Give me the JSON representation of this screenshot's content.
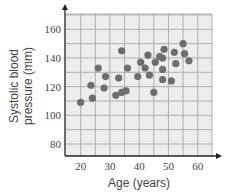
{
  "chart_data": {
    "type": "scatter",
    "title": "",
    "xlabel": "Age (years)",
    "ylabel": "Systolic blood pressure (mm)",
    "ylabel_lines": [
      "Systolic blood",
      "pressure (mm)"
    ],
    "xlim": [
      15,
      65
    ],
    "ylim": [
      70,
      170
    ],
    "xticks": [
      20,
      30,
      40,
      50,
      60
    ],
    "yticks": [
      80,
      100,
      120,
      140,
      160
    ],
    "grid": true,
    "legend": null,
    "points": [
      {
        "x": 20,
        "y": 109
      },
      {
        "x": 23.5,
        "y": 121
      },
      {
        "x": 24,
        "y": 112
      },
      {
        "x": 26,
        "y": 133
      },
      {
        "x": 28.5,
        "y": 127
      },
      {
        "x": 28,
        "y": 119
      },
      {
        "x": 32,
        "y": 114
      },
      {
        "x": 33,
        "y": 126
      },
      {
        "x": 34,
        "y": 145
      },
      {
        "x": 34,
        "y": 116
      },
      {
        "x": 35.5,
        "y": 117
      },
      {
        "x": 36,
        "y": 133
      },
      {
        "x": 39.5,
        "y": 127
      },
      {
        "x": 40.5,
        "y": 137
      },
      {
        "x": 42,
        "y": 133
      },
      {
        "x": 43,
        "y": 142
      },
      {
        "x": 43.5,
        "y": 128
      },
      {
        "x": 45,
        "y": 116
      },
      {
        "x": 45.5,
        "y": 137
      },
      {
        "x": 47,
        "y": 141
      },
      {
        "x": 48,
        "y": 140
      },
      {
        "x": 48.5,
        "y": 146
      },
      {
        "x": 48,
        "y": 132
      },
      {
        "x": 48,
        "y": 125
      },
      {
        "x": 51,
        "y": 124
      },
      {
        "x": 52,
        "y": 144
      },
      {
        "x": 52.5,
        "y": 136
      },
      {
        "x": 55,
        "y": 150
      },
      {
        "x": 55.5,
        "y": 143
      },
      {
        "x": 57,
        "y": 138
      }
    ],
    "colors": {
      "point": "#6e6e6e",
      "grid": "#a0a0a0",
      "background": "#ededed",
      "axis": "#222222"
    }
  }
}
